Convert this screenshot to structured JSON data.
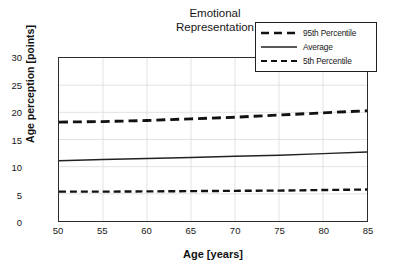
{
  "chart_data": {
    "type": "line",
    "title": "Emotional Representation",
    "title_lines": [
      "Emotional",
      "Representation"
    ],
    "xlabel": "Age [years]",
    "ylabel": "Age perception [points]",
    "xlim": [
      50,
      85
    ],
    "ylim": [
      0,
      30
    ],
    "xticks": [
      50,
      55,
      60,
      65,
      70,
      75,
      80,
      85
    ],
    "yticks": [
      0,
      5,
      10,
      15,
      20,
      25,
      30
    ],
    "grid": true,
    "legend_position": "top-right",
    "x": [
      50,
      55,
      60,
      65,
      70,
      75,
      80,
      85
    ],
    "series": [
      {
        "name": "95th Percentile",
        "style": "dashed-thick",
        "color": "#111111",
        "values": [
          18.2,
          18.3,
          18.5,
          18.8,
          19.1,
          19.5,
          19.9,
          20.3
        ]
      },
      {
        "name": "Average",
        "style": "solid",
        "color": "#222222",
        "values": [
          11.1,
          11.3,
          11.5,
          11.7,
          11.9,
          12.1,
          12.4,
          12.7
        ]
      },
      {
        "name": "5th Percentile",
        "style": "dashed-thin",
        "color": "#111111",
        "values": [
          5.4,
          5.4,
          5.45,
          5.5,
          5.55,
          5.6,
          5.7,
          5.8
        ]
      }
    ]
  },
  "legend": {
    "items": [
      {
        "label": "95th Percentile"
      },
      {
        "label": "Average"
      },
      {
        "label": "5th Percentile"
      }
    ]
  },
  "colors": {
    "axis": "#2b2b2b",
    "grid": "#e2e2e2",
    "text": "#161616",
    "background": "#ffffff"
  }
}
